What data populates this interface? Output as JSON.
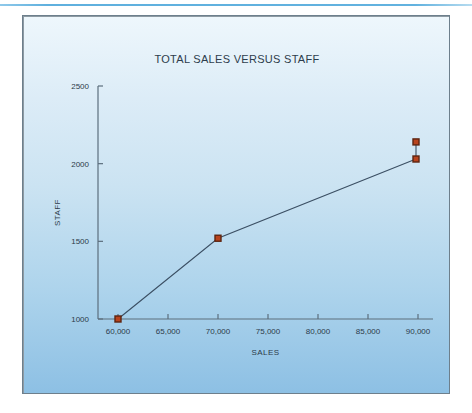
{
  "page": {
    "background_color": "#ffffff",
    "rule_color": "#5fb0de"
  },
  "panel": {
    "gradient_top_color": "#eef7fc",
    "gradient_bottom_color": "#8dc0e4",
    "border_color": "#6d7f8c"
  },
  "chart_data": {
    "type": "line",
    "title": "TOTAL SALES VERSUS STAFF",
    "xlabel": "SALES",
    "ylabel": "STAFF",
    "xlim": [
      58000,
      91500
    ],
    "ylim": [
      1000,
      2500
    ],
    "xticks": [
      60000,
      65000,
      70000,
      75000,
      80000,
      85000,
      90000
    ],
    "xtick_labels": [
      "60,000",
      "65,000",
      "70,000",
      "75,000",
      "80,000",
      "85,000",
      "90,000"
    ],
    "yticks": [
      1000,
      1500,
      2000,
      2500
    ],
    "ytick_labels": [
      "1000",
      "1500",
      "2000",
      "2500"
    ],
    "grid": false,
    "legend": "none",
    "line_color": "#3b4f63",
    "marker_color": "#b8431d",
    "marker_edge_color": "#5d2410",
    "marker_shape": "square",
    "series": [
      {
        "name": "Staff vs Sales",
        "x": [
          60000,
          70000,
          89800
        ],
        "y": [
          1000,
          1520,
          2030
        ]
      },
      {
        "name": "Outlier point",
        "x": [
          89800,
          89800
        ],
        "y": [
          2030,
          2140
        ]
      }
    ],
    "points": [
      {
        "x": 60000,
        "y": 1000
      },
      {
        "x": 70000,
        "y": 1520
      },
      {
        "x": 89800,
        "y": 2030
      },
      {
        "x": 89800,
        "y": 2140
      }
    ]
  }
}
